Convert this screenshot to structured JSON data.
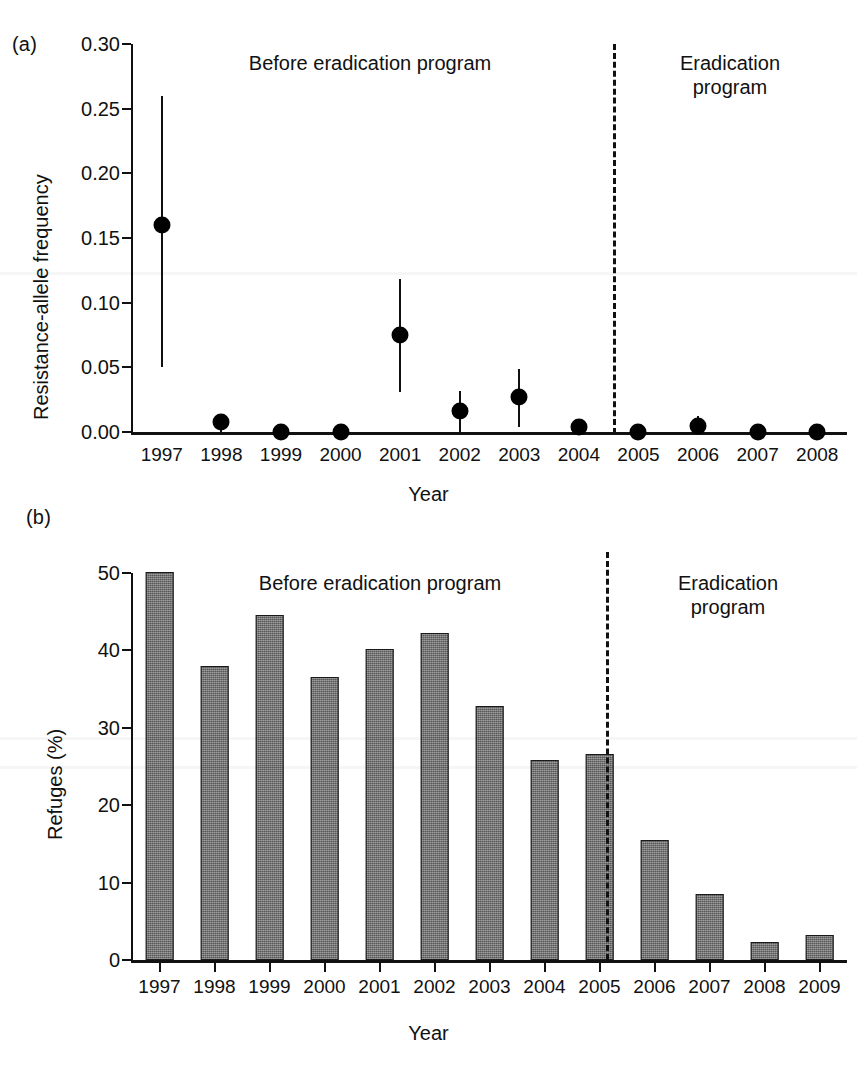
{
  "figure": {
    "panel_a_label": "(a)",
    "panel_b_label": "(b)",
    "caption_fragment": ""
  },
  "chart_data": [
    {
      "id": "panel-a",
      "type": "scatter",
      "title": "",
      "panel": "(a)",
      "xlabel": "Year",
      "ylabel": "Resistance-allele frequency",
      "categories": [
        "1997",
        "1998",
        "1999",
        "2000",
        "2001",
        "2002",
        "2003",
        "2004",
        "2005",
        "2006",
        "2007",
        "2008"
      ],
      "values": [
        0.16,
        0.008,
        0.0,
        0.0,
        0.075,
        0.016,
        0.027,
        0.004,
        0.0,
        0.005,
        0.0,
        0.0
      ],
      "error_low": [
        0.05,
        0.0,
        0.0,
        0.0,
        0.031,
        0.0,
        0.004,
        0.0,
        0.0,
        0.0,
        0.0,
        0.0
      ],
      "error_high": [
        0.26,
        0.014,
        0.0,
        0.0,
        0.118,
        0.032,
        0.049,
        0.008,
        0.0,
        0.012,
        0.0,
        0.0
      ],
      "ylim": [
        0.0,
        0.3
      ],
      "yticks": [
        "0.00",
        "0.05",
        "0.10",
        "0.15",
        "0.20",
        "0.25",
        "0.30"
      ],
      "ytick_values": [
        0.0,
        0.05,
        0.1,
        0.15,
        0.2,
        0.25,
        0.3
      ],
      "grid": false,
      "legend": "none",
      "annotations": [
        {
          "text": "Before eradication program",
          "at_year": "2000.5"
        },
        {
          "text": "Eradication\nprogram",
          "at_year": "2006.8"
        }
      ],
      "divider_after": "2005"
    },
    {
      "id": "panel-b",
      "type": "bar",
      "title": "",
      "panel": "(b)",
      "xlabel": "Year",
      "ylabel": "Refuges (%)",
      "categories": [
        "1997",
        "1998",
        "1999",
        "2000",
        "2001",
        "2002",
        "2003",
        "2004",
        "2005",
        "2006",
        "2007",
        "2008",
        "2009"
      ],
      "values": [
        50.1,
        38.0,
        44.6,
        36.5,
        40.2,
        42.2,
        32.8,
        25.9,
        26.6,
        15.5,
        8.5,
        2.3,
        3.2
      ],
      "ylim": [
        0,
        50
      ],
      "yticks": [
        "0",
        "10",
        "20",
        "30",
        "40",
        "50"
      ],
      "ytick_values": [
        0,
        10,
        20,
        30,
        40,
        50
      ],
      "grid": false,
      "legend": "none",
      "bar_color": "#6f6f6f",
      "bar_edge_color": "#1a1a1a",
      "annotations": [
        {
          "text": "Before eradication program",
          "at_year": "2001.2"
        },
        {
          "text": "Eradication\nprogram",
          "at_year": "2007.3"
        }
      ],
      "divider_after": "2005"
    }
  ]
}
